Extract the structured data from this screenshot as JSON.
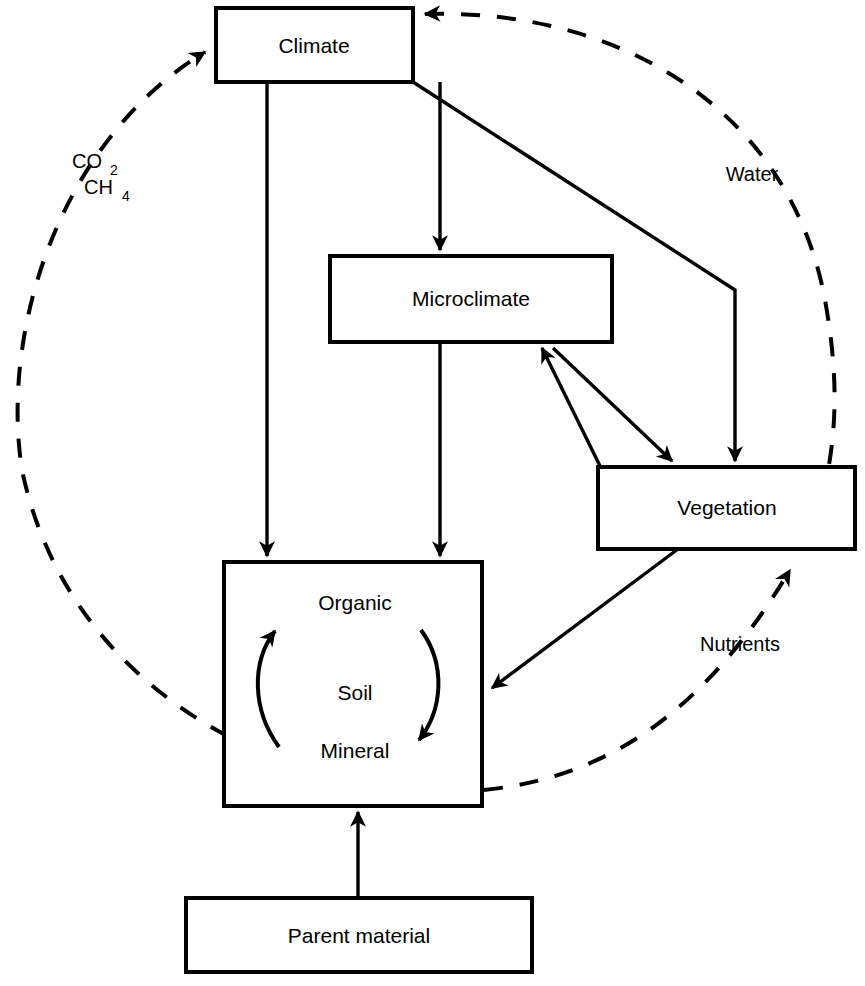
{
  "diagram": {
    "nodes": [
      {
        "id": "climate",
        "label": "Climate"
      },
      {
        "id": "microclimate",
        "label": "Microclimate"
      },
      {
        "id": "vegetation",
        "label": "Vegetation"
      },
      {
        "id": "soil",
        "label": "Soil"
      },
      {
        "id": "soil_organic",
        "label": "Organic"
      },
      {
        "id": "soil_mineral",
        "label": "Mineral"
      },
      {
        "id": "parent_material",
        "label": "Parent material"
      }
    ],
    "edge_labels": {
      "co2": "CO",
      "co2_sub": "2",
      "ch4": "CH",
      "ch4_sub": "4",
      "water": "Water",
      "nutrients": "Nutrients"
    },
    "colors": {
      "stroke": "#000000",
      "fill": "#ffffff",
      "background": "#ffffff"
    }
  }
}
